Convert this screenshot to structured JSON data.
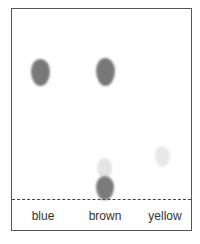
{
  "diagram": {
    "type": "paper chromatogram",
    "lanes": [
      {
        "label": "blue",
        "spots": [
          {
            "shade": "dark",
            "color": "#777777"
          }
        ]
      },
      {
        "label": "brown",
        "spots": [
          {
            "shade": "dark",
            "color": "#777777"
          },
          {
            "shade": "light",
            "color": "#e4e4e4"
          },
          {
            "shade": "dark",
            "color": "#7a7a7a"
          }
        ]
      },
      {
        "label": "yellow",
        "spots": [
          {
            "shade": "light",
            "color": "#e8e8e8"
          }
        ]
      }
    ],
    "baseline_style": "dashed"
  }
}
